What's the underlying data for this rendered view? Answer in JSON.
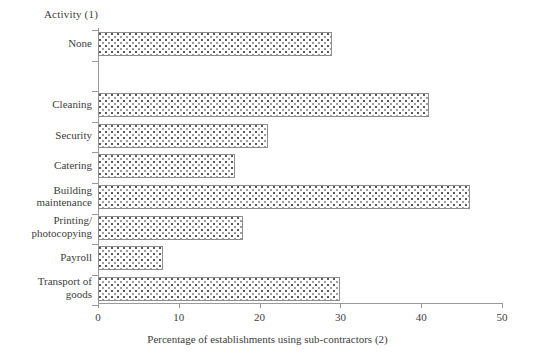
{
  "chart_data": {
    "type": "bar",
    "orientation": "horizontal",
    "title": "",
    "ylabel": "Activity (1)",
    "xlabel": "Percentage of establishments using sub-contractors (2)",
    "xlim": [
      0,
      50
    ],
    "xticks": [
      0,
      10,
      20,
      30,
      40,
      50
    ],
    "xtick_labels": [
      "0",
      "10",
      "20",
      "30",
      "40",
      "50"
    ],
    "grid": false,
    "legend": null,
    "categories": [
      "None",
      "Cleaning",
      "Security",
      "Catering",
      "Building maintenance",
      "Printing/ photocopying",
      "Payroll",
      "Transport of goods"
    ],
    "values": [
      29,
      41,
      21,
      17,
      46,
      18,
      8,
      30
    ],
    "bars": [
      {
        "label_lines": [
          "None"
        ],
        "value": 29,
        "slot": 0
      },
      {
        "label_lines": [
          "Cleaning"
        ],
        "value": 41,
        "slot": 2
      },
      {
        "label_lines": [
          "Security"
        ],
        "value": 21,
        "slot": 3
      },
      {
        "label_lines": [
          "Catering"
        ],
        "value": 17,
        "slot": 4
      },
      {
        "label_lines": [
          "Building",
          "maintenance"
        ],
        "value": 46,
        "slot": 5
      },
      {
        "label_lines": [
          "Printing/",
          "photocopying"
        ],
        "value": 18,
        "slot": 6
      },
      {
        "label_lines": [
          "Payroll"
        ],
        "value": 8,
        "slot": 7
      },
      {
        "label_lines": [
          "Transport of",
          "goods"
        ],
        "value": 30,
        "slot": 8
      }
    ],
    "colors": {
      "bar_fill": "#ffffff",
      "bar_pattern": "#5a5a5a",
      "bar_border": "#8d8d8d",
      "axis": "#9a9a9a",
      "text": "#3d3d3d",
      "background": "#ffffff"
    }
  }
}
